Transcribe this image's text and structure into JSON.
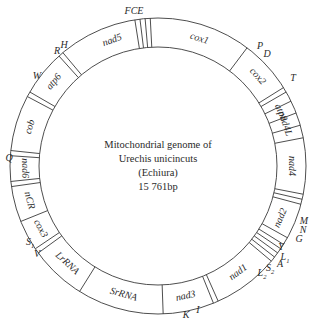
{
  "title": {
    "line1": "Mitochondrial genome of",
    "line2": "Urechis unicincuts",
    "line3": "(Echiura)",
    "line4": "15 761bp"
  },
  "ring": {
    "cx": 158,
    "cy": 166,
    "outer_r": 148,
    "inner_r": 119,
    "stroke": "#3a3a3a"
  },
  "boundaries_deg": [
    -9,
    -7,
    -5,
    -3,
    37,
    58,
    60,
    64,
    69,
    74,
    79,
    101,
    103,
    105,
    119,
    122,
    124,
    126,
    128,
    130,
    156,
    158,
    178,
    212,
    234,
    236,
    248,
    262,
    264,
    274,
    276,
    298,
    300,
    318,
    320
  ],
  "genes": [
    {
      "label": "cox1",
      "angle": 18
    },
    {
      "label": "cox2",
      "angle": 48
    },
    {
      "label": "atp8",
      "angle": 66.5
    },
    {
      "label": "nad4L",
      "angle": 71.5
    },
    {
      "label": "nad4",
      "angle": 90
    },
    {
      "label": "nad2",
      "angle": 113
    },
    {
      "label": "nad1",
      "angle": 143
    },
    {
      "label": "nad3",
      "angle": 168
    },
    {
      "label": "SrRNA",
      "angle": 195
    },
    {
      "label": "LrRNA",
      "angle": 223
    },
    {
      "label": "cox3",
      "angle": 242
    },
    {
      "label": "nCR",
      "angle": 255
    },
    {
      "label": "nad6",
      "angle": 269
    },
    {
      "label": "cob",
      "angle": 287
    },
    {
      "label": "atp6",
      "angle": 309
    },
    {
      "label": "nad5",
      "angle": 340
    }
  ],
  "trnas": [
    {
      "label": "FCE",
      "x": 134,
      "y": 14
    },
    {
      "label": "P",
      "x": 260,
      "y": 49
    },
    {
      "label": "D",
      "x": 267,
      "y": 57
    },
    {
      "label": "T",
      "x": 293,
      "y": 81
    },
    {
      "label": "M",
      "x": 304,
      "y": 224
    },
    {
      "label": "N",
      "x": 303,
      "y": 233
    },
    {
      "label": "G",
      "x": 299,
      "y": 242
    },
    {
      "label": "Y",
      "x": 281,
      "y": 250
    },
    {
      "label": "L1",
      "x": 285,
      "y": 260
    },
    {
      "label": "A",
      "x": 280,
      "y": 267
    },
    {
      "label": "S2",
      "x": 270,
      "y": 271
    },
    {
      "label": "L2",
      "x": 262,
      "y": 276
    },
    {
      "label": "I",
      "x": 198,
      "y": 313
    },
    {
      "label": "K",
      "x": 186,
      "y": 318
    },
    {
      "label": "V",
      "x": 37,
      "y": 257
    },
    {
      "label": "S1",
      "x": 30,
      "y": 245
    },
    {
      "label": "Q",
      "x": 9,
      "y": 161
    },
    {
      "label": "W",
      "x": 37,
      "y": 79
    },
    {
      "label": "R",
      "x": 57,
      "y": 54
    },
    {
      "label": "H",
      "x": 64,
      "y": 48
    }
  ]
}
